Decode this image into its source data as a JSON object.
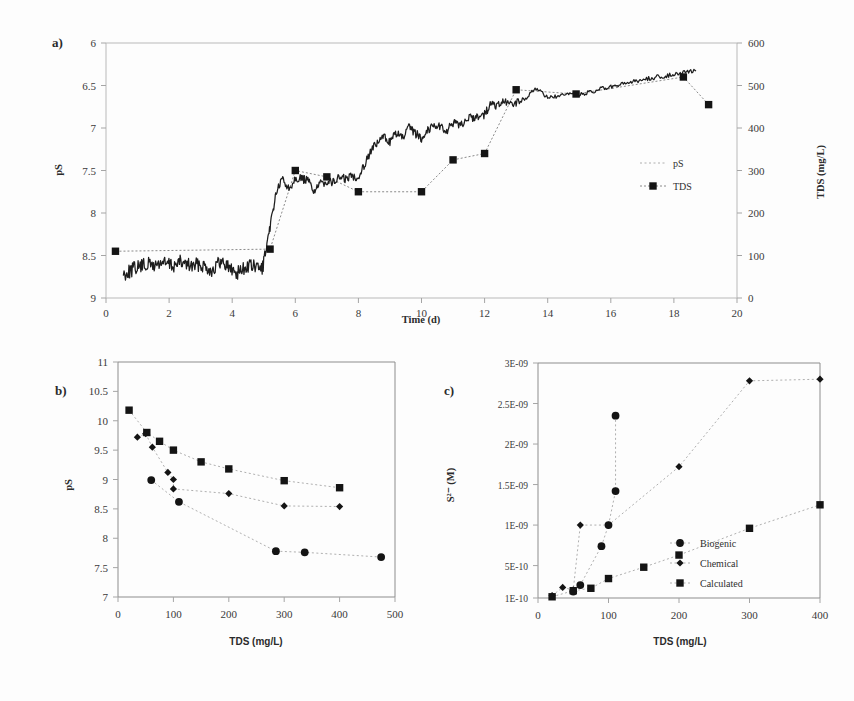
{
  "figure": {
    "panels": [
      "a)",
      "b)",
      "c)"
    ]
  },
  "panel_a": {
    "letter": "a)",
    "chart_data": {
      "type": "line",
      "title": "",
      "xlabel": "Time (d)",
      "ylabel": "pS",
      "y2label": "TDS (mg/L)",
      "xlim": [
        0,
        20
      ],
      "ylim": [
        9,
        6
      ],
      "y2lim": [
        0,
        600
      ],
      "xticks": [
        0,
        2,
        4,
        6,
        8,
        10,
        12,
        14,
        16,
        18,
        20
      ],
      "yticks": [
        6,
        6.5,
        7,
        7.5,
        8,
        8.5,
        9
      ],
      "y2ticks": [
        0,
        100,
        200,
        300,
        400,
        500,
        600
      ],
      "y_inverted": true,
      "grid": false,
      "legend_position": "right",
      "series": [
        {
          "name": "pS",
          "marker": "none",
          "style": "solid-noisy",
          "x": [
            0.55,
            0.75,
            0.95,
            1.15,
            1.35,
            1.55,
            1.75,
            1.95,
            2.15,
            2.35,
            2.55,
            2.75,
            2.95,
            3.15,
            3.35,
            3.55,
            3.75,
            3.95,
            4.15,
            4.35,
            4.55,
            4.75,
            4.95,
            5.1,
            5.25,
            5.4,
            5.6,
            5.8,
            6.0,
            6.2,
            6.4,
            6.6,
            6.8,
            7.0,
            7.2,
            7.4,
            7.6,
            7.8,
            8.0,
            8.2,
            8.4,
            8.6,
            8.8,
            9.0,
            9.2,
            9.4,
            9.6,
            9.8,
            10.0,
            10.2,
            10.4,
            10.6,
            10.8,
            11.0,
            11.2,
            11.4,
            11.6,
            11.8,
            12.0,
            12.2,
            12.4,
            12.6,
            12.8,
            13.0,
            13.3,
            13.6,
            13.9,
            14.2,
            14.5,
            14.8,
            15.1,
            15.4,
            15.7,
            16.0,
            16.3,
            16.6,
            16.9,
            17.2,
            17.5,
            17.8,
            18.1,
            18.4,
            18.7
          ],
          "y": [
            8.72,
            8.68,
            8.64,
            8.62,
            8.6,
            8.62,
            8.58,
            8.6,
            8.62,
            8.58,
            8.6,
            8.63,
            8.6,
            8.62,
            8.68,
            8.6,
            8.58,
            8.66,
            8.7,
            8.66,
            8.62,
            8.64,
            8.66,
            8.4,
            8.05,
            7.75,
            7.6,
            7.72,
            7.58,
            7.6,
            7.62,
            7.74,
            7.66,
            7.62,
            7.64,
            7.58,
            7.6,
            7.56,
            7.58,
            7.42,
            7.26,
            7.18,
            7.1,
            7.16,
            7.06,
            7.12,
            7.0,
            7.06,
            7.12,
            7.02,
            6.96,
            6.98,
            7.04,
            6.94,
            6.98,
            6.9,
            6.88,
            6.86,
            6.84,
            6.72,
            6.74,
            6.7,
            6.72,
            6.7,
            6.66,
            6.52,
            6.62,
            6.64,
            6.62,
            6.6,
            6.6,
            6.58,
            6.54,
            6.52,
            6.5,
            6.46,
            6.44,
            6.42,
            6.4,
            6.38,
            6.36,
            6.34,
            6.33
          ]
        },
        {
          "name": "TDS",
          "marker": "square",
          "style": "dotted",
          "x": [
            0.3,
            5.2,
            6.0,
            7.0,
            8.0,
            10.0,
            11.0,
            12.0,
            13.0,
            14.9,
            18.3,
            19.1
          ],
          "y_tds": [
            110,
            115,
            300,
            285,
            250,
            250,
            325,
            340,
            490,
            480,
            520,
            455
          ]
        }
      ],
      "legend": [
        {
          "label": "pS",
          "marker": "none"
        },
        {
          "label": "TDS",
          "marker": "square"
        }
      ]
    }
  },
  "panel_b": {
    "letter": "b)",
    "chart_data": {
      "type": "scatter",
      "title": "",
      "xlabel": "TDS (mg/L)",
      "ylabel": "pS",
      "xlim": [
        0,
        500
      ],
      "ylim": [
        7,
        11
      ],
      "xticks": [
        0,
        100,
        200,
        300,
        400,
        500
      ],
      "yticks": [
        7,
        7.5,
        8,
        8.5,
        9,
        9.5,
        10,
        10.5,
        11
      ],
      "grid": false,
      "legend_position": "none",
      "series": [
        {
          "name": "series-square",
          "marker": "square",
          "x": [
            20,
            52,
            75,
            100,
            150,
            200,
            300,
            400
          ],
          "y": [
            10.18,
            9.8,
            9.65,
            9.5,
            9.3,
            9.18,
            8.98,
            8.86
          ]
        },
        {
          "name": "series-diamond",
          "marker": "diamond",
          "x": [
            35,
            50,
            62,
            90,
            100,
            100,
            200,
            300,
            400
          ],
          "y": [
            9.72,
            9.78,
            9.55,
            9.12,
            9.0,
            8.84,
            8.76,
            8.55,
            8.54
          ]
        },
        {
          "name": "series-circle",
          "marker": "circle",
          "x": [
            60,
            110,
            285,
            337,
            475
          ],
          "y": [
            8.99,
            8.62,
            7.78,
            7.76,
            7.68
          ]
        }
      ]
    }
  },
  "panel_c": {
    "letter": "c)",
    "chart_data": {
      "type": "scatter",
      "title": "",
      "xlabel": "TDS (mg/L)",
      "ylabel": "S²⁻ (M)",
      "xlim": [
        0,
        400
      ],
      "ylim": [
        1e-10,
        3e-09
      ],
      "xticks": [
        0,
        100,
        200,
        300,
        400
      ],
      "yticks": [
        1e-10,
        5e-10,
        1e-09,
        1.5e-09,
        2e-09,
        2.5e-09,
        3e-09
      ],
      "ytick_labels": [
        "1E-10",
        "5E-10",
        "1E-09",
        "1.5E-09",
        "2E-09",
        "2.5E-09",
        "3E-09"
      ],
      "grid": false,
      "legend_position": "inside-right",
      "series": [
        {
          "name": "Biogenic",
          "marker": "circle",
          "x": [
            50,
            60,
            90,
            100,
            110,
            110
          ],
          "y": [
            1.8e-10,
            2.6e-10,
            7.4e-10,
            1e-09,
            1.42e-09,
            2.35e-09
          ]
        },
        {
          "name": "Chemical",
          "marker": "diamond",
          "x": [
            20,
            35,
            50,
            60,
            100,
            200,
            300,
            400
          ],
          "y": [
            1.3e-10,
            2.3e-10,
            2e-10,
            1e-09,
            1e-09,
            1.72e-09,
            2.78e-09,
            2.8e-09
          ]
        },
        {
          "name": "Calculated",
          "marker": "square",
          "x": [
            20,
            50,
            75,
            100,
            150,
            200,
            300,
            400
          ],
          "y": [
            1.15e-10,
            1.9e-10,
            2.2e-10,
            3.4e-10,
            4.8e-10,
            6.3e-10,
            9.6e-10,
            1.25e-09
          ]
        }
      ],
      "legend": [
        {
          "label": "Biogenic",
          "marker": "circle"
        },
        {
          "label": "Chemical",
          "marker": "diamond"
        },
        {
          "label": "Calculated",
          "marker": "square"
        }
      ]
    }
  }
}
